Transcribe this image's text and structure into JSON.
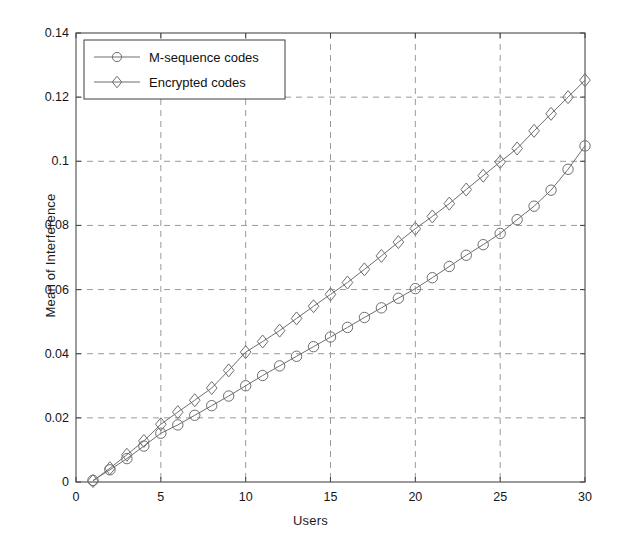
{
  "chart_data": {
    "type": "line",
    "title": "",
    "xlabel": "Users",
    "ylabel": "Mean of Interference",
    "xlim": [
      0,
      30
    ],
    "ylim": [
      0,
      0.14
    ],
    "xticks": [
      0,
      5,
      10,
      15,
      20,
      25,
      30
    ],
    "xtick_labels": [
      "0",
      "5",
      "10",
      "15",
      "20",
      "25",
      "30"
    ],
    "yticks": [
      0,
      0.02,
      0.04,
      0.06,
      0.08,
      0.1,
      0.12,
      0.14
    ],
    "ytick_labels": [
      "0",
      "0.02",
      "0.04",
      "0.06",
      "0.08",
      "0.1",
      "0.12",
      "0.14"
    ],
    "grid": true,
    "grid_style": "dashed",
    "legend_position": "upper-left",
    "x": [
      1,
      2,
      3,
      4,
      5,
      6,
      7,
      8,
      9,
      10,
      11,
      12,
      13,
      14,
      15,
      16,
      17,
      18,
      19,
      20,
      21,
      22,
      23,
      24,
      25,
      26,
      27,
      28,
      29,
      30
    ],
    "series": [
      {
        "name": "M-sequence codes",
        "marker": "circle",
        "color": "#6e6e6e",
        "values": [
          0.0005,
          0.0038,
          0.0073,
          0.0112,
          0.0152,
          0.0178,
          0.0208,
          0.0238,
          0.0268,
          0.03,
          0.0332,
          0.0362,
          0.0392,
          0.0422,
          0.0452,
          0.0482,
          0.0513,
          0.0543,
          0.0573,
          0.0603,
          0.0637,
          0.0672,
          0.0707,
          0.074,
          0.0775,
          0.0818,
          0.086,
          0.091,
          0.0975,
          0.1048
        ]
      },
      {
        "name": "Encrypted codes",
        "marker": "diamond",
        "color": "#6e6e6e",
        "values": [
          0.0003,
          0.0043,
          0.0085,
          0.0128,
          0.018,
          0.0218,
          0.0255,
          0.0293,
          0.0348,
          0.0405,
          0.0438,
          0.0472,
          0.051,
          0.0548,
          0.0585,
          0.0622,
          0.0663,
          0.0705,
          0.0748,
          0.079,
          0.0828,
          0.0868,
          0.0912,
          0.0955,
          0.0998,
          0.104,
          0.1095,
          0.1148,
          0.12,
          0.1253
        ]
      }
    ]
  },
  "legend": {
    "items": [
      {
        "label": "M-sequence codes",
        "marker": "circle-icon"
      },
      {
        "label": "Encrypted codes",
        "marker": "diamond-icon"
      }
    ]
  },
  "style": {
    "axis_color": "#4a4a4a",
    "grid_color": "#9a9a9a",
    "line_color": "#6e6e6e",
    "background": "#ffffff",
    "text_color": "#161616"
  }
}
